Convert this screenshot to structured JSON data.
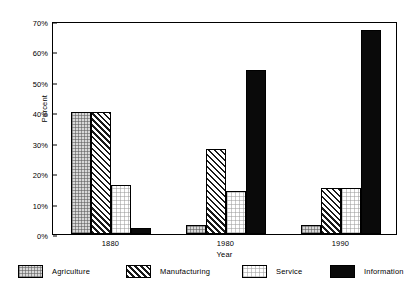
{
  "chart_data": {
    "type": "bar",
    "title": "",
    "xlabel": "Year",
    "ylabel": "Percent",
    "categories": [
      "1880",
      "1980",
      "1990"
    ],
    "ylim": [
      0,
      70
    ],
    "ytick_values": [
      0,
      10,
      20,
      30,
      40,
      50,
      60,
      70
    ],
    "ytick_labels": [
      "0%",
      "10%",
      "20%",
      "30%",
      "40%",
      "50%",
      "60%",
      "70%"
    ],
    "grid": false,
    "legend_position": "bottom",
    "series": [
      {
        "name": "Agriculture",
        "values": [
          40,
          3,
          3
        ],
        "pattern": "light-checker",
        "color": "#d8d8d8"
      },
      {
        "name": "Manufacturing",
        "values": [
          40,
          28,
          15
        ],
        "pattern": "diagonal-hatch",
        "color": "#ffffff"
      },
      {
        "name": "Service",
        "values": [
          16,
          14,
          15
        ],
        "pattern": "fine-dots",
        "color": "#ffffff"
      },
      {
        "name": "Information",
        "values": [
          2,
          54,
          67
        ],
        "pattern": "solid",
        "color": "#0a0a0a"
      }
    ]
  },
  "axes": {
    "y_label": "Percent",
    "x_label": "Year"
  },
  "legend": {
    "items": [
      {
        "label": "Agriculture"
      },
      {
        "label": "Manufacturing"
      },
      {
        "label": "Service"
      },
      {
        "label": "Information"
      }
    ]
  }
}
